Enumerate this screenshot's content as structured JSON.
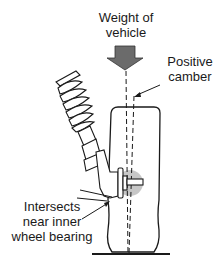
{
  "diagram": {
    "labels": {
      "weight_line1": "Weight of",
      "weight_line2": "vehicle",
      "camber_line1": "Positive",
      "camber_line2": "camber",
      "intersects_line1": "Intersects",
      "intersects_line2": "near inner",
      "intersects_line3": "wheel bearing"
    },
    "colors": {
      "line": "#1a1a1a",
      "arrow_fill": "#6b6b6b",
      "highlight": "#bdbdbd",
      "background": "#ffffff"
    },
    "elements": [
      "weight-arrow",
      "coil-spring",
      "strut",
      "steering-knuckle",
      "tire",
      "hub-highlight",
      "ground-line",
      "vertical-centerline",
      "camber-line"
    ]
  }
}
